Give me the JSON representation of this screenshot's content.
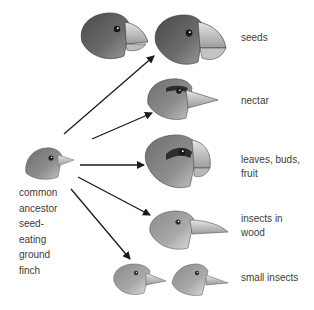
{
  "diagram": {
    "type": "adaptive-radiation",
    "ancestor": {
      "label_lines": [
        "common",
        "ancestor",
        "seed-",
        "eating",
        "ground",
        "finch"
      ]
    },
    "descendants": [
      {
        "id": "seeds",
        "label_lines": [
          "seeds"
        ],
        "head_count": 2
      },
      {
        "id": "nectar",
        "label_lines": [
          "nectar"
        ],
        "head_count": 1
      },
      {
        "id": "leaves",
        "label_lines": [
          "leaves, buds,",
          "fruit"
        ],
        "head_count": 1
      },
      {
        "id": "insects-wood",
        "label_lines": [
          "insects in",
          "wood"
        ],
        "head_count": 1
      },
      {
        "id": "small-insects",
        "label_lines": [
          "small insects"
        ],
        "head_count": 2
      }
    ],
    "arrows": [
      {
        "to": "seeds",
        "from": [
          64,
          134
        ],
        "end": [
          154,
          56
        ]
      },
      {
        "to": "nectar",
        "from": [
          92,
          139
        ],
        "end": [
          152,
          113
        ]
      },
      {
        "to": "leaves",
        "from": [
          80,
          165
        ],
        "end": [
          144,
          165
        ]
      },
      {
        "to": "insects-wood",
        "from": [
          78,
          177
        ],
        "end": [
          150,
          215
        ]
      },
      {
        "to": "small-insects",
        "from": [
          71,
          189
        ],
        "end": [
          130,
          259
        ]
      }
    ],
    "colors": {
      "arrow": "#1a1a1a",
      "text": "#3c3c3c",
      "background": "#ffffff"
    }
  }
}
